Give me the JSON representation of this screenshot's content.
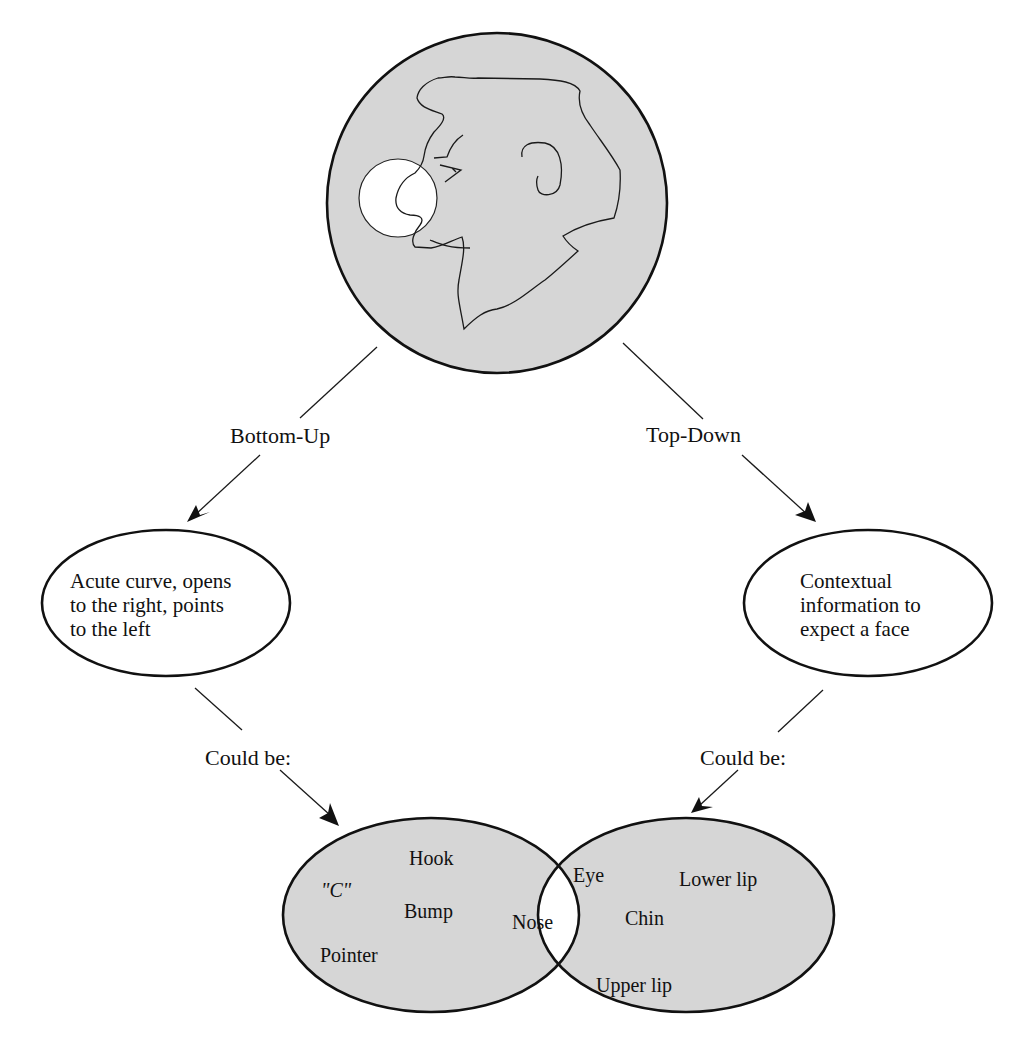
{
  "diagram": {
    "title_figure": {
      "description": "Profile face drawing in gray circle with highlighted nose region",
      "fill_color": "#d6d6d6",
      "highlight_color": "#ffffff"
    },
    "branches": {
      "left": {
        "label": "Bottom-Up",
        "node_lines": [
          "Acute curve, opens",
          "to the right, points",
          "to the left"
        ],
        "connector_label": "Could be:"
      },
      "right": {
        "label": "Top-Down",
        "node_lines": [
          "Contextual",
          "information to",
          "expect a face"
        ],
        "connector_label": "Could be:"
      }
    },
    "venn": {
      "left_set": {
        "items": [
          "Hook",
          "\"C\"",
          "Bump",
          "Pointer"
        ]
      },
      "intersection": {
        "items": [
          "Nose"
        ]
      },
      "right_set": {
        "items": [
          "Eye",
          "Lower lip",
          "Chin",
          "Upper lip"
        ]
      },
      "fill_color": "#d6d6d6"
    }
  }
}
